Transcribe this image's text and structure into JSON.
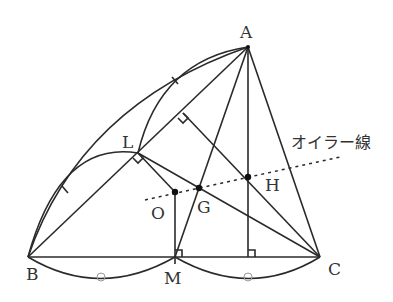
{
  "diagram": {
    "points": {
      "A": {
        "label": "A",
        "x": 248,
        "y": 47
      },
      "B": {
        "label": "B",
        "x": 28,
        "y": 257
      },
      "C": {
        "label": "C",
        "x": 320,
        "y": 257
      },
      "L": {
        "label": "L",
        "x": 138,
        "y": 153
      },
      "M": {
        "label": "M",
        "x": 175,
        "y": 257
      },
      "O": {
        "label": "O",
        "x": 175,
        "y": 192
      },
      "G": {
        "label": "G",
        "x": 199,
        "y": 188
      },
      "H": {
        "label": "H",
        "x": 248,
        "y": 177
      }
    },
    "euler_line_label": "オイラー線"
  }
}
